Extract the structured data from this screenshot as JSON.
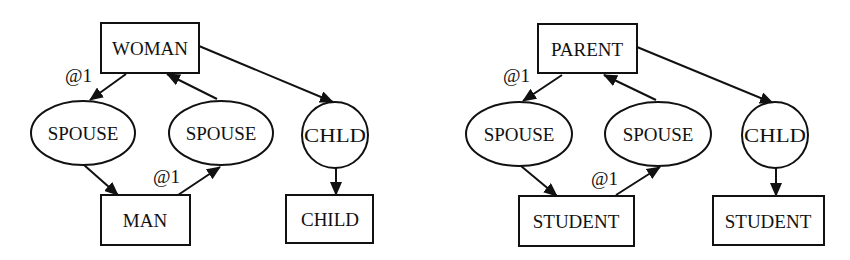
{
  "diagrams": [
    {
      "nodes": {
        "woman": "WOMAN",
        "spouse_a": "SPOUSE",
        "spouse_b": "SPOUSE",
        "chld": "CHLD",
        "man": "MAN",
        "child": "CHILD"
      },
      "annotations": {
        "woman_to_spouse_a": "@1",
        "man_to_spouse_b": "@1"
      }
    },
    {
      "nodes": {
        "parent": "PARENT",
        "spouse_a": "SPOUSE",
        "spouse_b": "SPOUSE",
        "chld": "CHLD",
        "student": "STUDENT",
        "student_child": "STUDENT"
      },
      "annotations": {
        "parent_to_spouse_a": "@1",
        "student_to_spouse_b": "@1"
      }
    }
  ],
  "edges": [
    {
      "diagram": 0,
      "from": "WOMAN",
      "to": "SPOUSE (left)",
      "label": "@1"
    },
    {
      "diagram": 0,
      "from": "SPOUSE (left)",
      "to": "MAN"
    },
    {
      "diagram": 0,
      "from": "MAN",
      "to": "SPOUSE (right)",
      "label": "@1"
    },
    {
      "diagram": 0,
      "from": "SPOUSE (right)",
      "to": "WOMAN"
    },
    {
      "diagram": 0,
      "from": "WOMAN",
      "to": "CHLD"
    },
    {
      "diagram": 0,
      "from": "CHLD",
      "to": "CHILD"
    },
    {
      "diagram": 1,
      "from": "PARENT",
      "to": "SPOUSE (left)",
      "label": "@1"
    },
    {
      "diagram": 1,
      "from": "SPOUSE (left)",
      "to": "STUDENT"
    },
    {
      "diagram": 1,
      "from": "STUDENT",
      "to": "SPOUSE (right)",
      "label": "@1"
    },
    {
      "diagram": 1,
      "from": "SPOUSE (right)",
      "to": "PARENT"
    },
    {
      "diagram": 1,
      "from": "PARENT",
      "to": "CHLD"
    },
    {
      "diagram": 1,
      "from": "CHLD",
      "to": "STUDENT (child)"
    }
  ]
}
